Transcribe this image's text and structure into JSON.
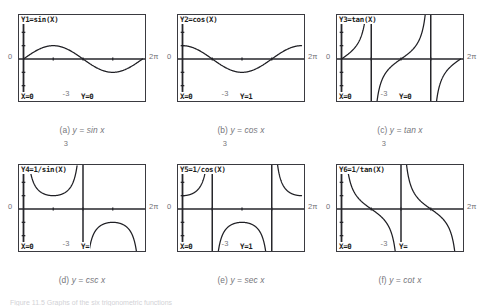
{
  "figure": {
    "bottom_caption": "Figure 11.5  Graphs of the six trigonometric functions",
    "window": {
      "ymax_label": "3",
      "ymin_label": "-3",
      "xmin_label": "0",
      "xmax_label": "2π"
    }
  },
  "panels": [
    {
      "id": "a",
      "fn_label": "Y1=sin(X)",
      "trace_x": "X=0",
      "trace_y": "Y=0",
      "caption_prefix": "(a)",
      "caption_body": "y  =  sin x",
      "curve": "sin",
      "ymax": "3",
      "ymin": "-3",
      "xmin": "0",
      "xmax": "2π"
    },
    {
      "id": "b",
      "fn_label": "Y2=cos(X)",
      "trace_x": "X=0",
      "trace_y": "Y=1",
      "caption_prefix": "(b)",
      "caption_body": "y  =  cos x",
      "curve": "cos",
      "ymax": "3",
      "ymin": "-3",
      "xmin": "0",
      "xmax": "2π"
    },
    {
      "id": "c",
      "fn_label": "Y3=tan(X)",
      "trace_x": "X=0",
      "trace_y": "Y=0",
      "caption_prefix": "(c)",
      "caption_body": "y  =  tan x",
      "curve": "tan",
      "ymax": "3",
      "ymin": "-3",
      "xmin": "0",
      "xmax": "2π"
    },
    {
      "id": "d",
      "fn_label": "Y4=1/sin(X)",
      "trace_x": "X=0",
      "trace_y": "Y=",
      "caption_prefix": "(d)",
      "caption_body": "y  =  csc x",
      "curve": "csc",
      "ymax": "3",
      "ymin": "-3",
      "xmin": "0",
      "xmax": "2π"
    },
    {
      "id": "e",
      "fn_label": "Y5=1/cos(X)",
      "trace_x": "X=0",
      "trace_y": "Y=1",
      "caption_prefix": "(e)",
      "caption_body": "y  =  sec x",
      "curve": "sec",
      "ymax": "3",
      "ymin": "-3",
      "xmin": "0",
      "xmax": "2π"
    },
    {
      "id": "f",
      "fn_label": "Y6=1/tan(X)",
      "trace_x": "X=0",
      "trace_y": "Y=",
      "caption_prefix": "(f)",
      "caption_body": "y  =  cot x",
      "curve": "cot",
      "ymax": "3",
      "ymin": "-3",
      "xmin": "0",
      "xmax": "2π"
    }
  ],
  "chart_data": [
    {
      "type": "line",
      "title": "Y1=sin(X)",
      "xlabel": "x",
      "ylabel": "y",
      "xlim": [
        0,
        6.283185
      ],
      "ylim": [
        -3,
        3
      ],
      "grid": false,
      "xticks": [
        "0",
        "2π"
      ],
      "yticks": [
        "-3",
        "3"
      ],
      "series": [
        {
          "name": "sin x",
          "expression": "sin(x)"
        }
      ],
      "annotations": [
        "X=0",
        "Y=0"
      ]
    },
    {
      "type": "line",
      "title": "Y2=cos(X)",
      "xlabel": "x",
      "ylabel": "y",
      "xlim": [
        0,
        6.283185
      ],
      "ylim": [
        -3,
        3
      ],
      "grid": false,
      "xticks": [
        "0",
        "2π"
      ],
      "yticks": [
        "-3",
        "3"
      ],
      "series": [
        {
          "name": "cos x",
          "expression": "cos(x)"
        }
      ],
      "annotations": [
        "X=0",
        "Y=1"
      ]
    },
    {
      "type": "line",
      "title": "Y3=tan(X)",
      "xlabel": "x",
      "ylabel": "y",
      "xlim": [
        0,
        6.283185
      ],
      "ylim": [
        -3,
        3
      ],
      "grid": false,
      "xticks": [
        "0",
        "2π"
      ],
      "yticks": [
        "-3",
        "3"
      ],
      "series": [
        {
          "name": "tan x",
          "expression": "tan(x)"
        }
      ],
      "asymptotes": [
        1.570796,
        4.712389
      ],
      "annotations": [
        "X=0",
        "Y=0"
      ]
    },
    {
      "type": "line",
      "title": "Y4=1/sin(X)",
      "xlabel": "x",
      "ylabel": "y",
      "xlim": [
        0,
        6.283185
      ],
      "ylim": [
        -3,
        3
      ],
      "grid": false,
      "xticks": [
        "0",
        "2π"
      ],
      "yticks": [
        "-3",
        "3"
      ],
      "series": [
        {
          "name": "csc x",
          "expression": "1/sin(x)"
        }
      ],
      "asymptotes": [
        3.141593
      ],
      "annotations": [
        "X=0",
        "Y="
      ]
    },
    {
      "type": "line",
      "title": "Y5=1/cos(X)",
      "xlabel": "x",
      "ylabel": "y",
      "xlim": [
        0,
        6.283185
      ],
      "ylim": [
        -3,
        3
      ],
      "grid": false,
      "xticks": [
        "0",
        "2π"
      ],
      "yticks": [
        "-3",
        "3"
      ],
      "series": [
        {
          "name": "sec x",
          "expression": "1/cos(x)"
        }
      ],
      "asymptotes": [
        1.570796,
        4.712389
      ],
      "annotations": [
        "X=0",
        "Y=1"
      ]
    },
    {
      "type": "line",
      "title": "Y6=1/tan(X)",
      "xlabel": "x",
      "ylabel": "y",
      "xlim": [
        0,
        6.283185
      ],
      "ylim": [
        -3,
        3
      ],
      "grid": false,
      "xticks": [
        "0",
        "2π"
      ],
      "yticks": [
        "-3",
        "3"
      ],
      "series": [
        {
          "name": "cot x",
          "expression": "1/tan(x)"
        }
      ],
      "asymptotes": [
        3.141593
      ],
      "annotations": [
        "X=0",
        "Y="
      ]
    }
  ],
  "colors": {
    "curve": "#1f1f24",
    "axis": "#26262b",
    "frame": "#3a3a40",
    "label_text": "#75757b",
    "screen_text": "#1c1c20"
  }
}
